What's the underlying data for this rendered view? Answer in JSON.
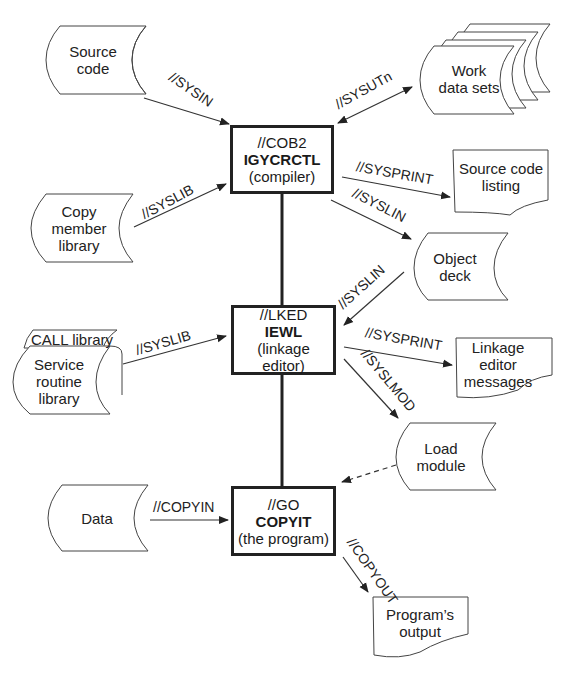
{
  "steps": {
    "compile": {
      "dd": "//COB2",
      "program": "IGYCRCTL",
      "desc": "(compiler)"
    },
    "link": {
      "dd": "//LKED",
      "program": "IEWL",
      "desc1": "(linkage",
      "desc2": "editor)"
    },
    "go": {
      "dd": "//GO",
      "program": "COPYIT",
      "desc": "(the program)"
    }
  },
  "datasets": {
    "source_code": {
      "line1": "Source",
      "line2": "code"
    },
    "work_data_sets": {
      "line1": "Work",
      "line2": "data sets"
    },
    "copy_member_library": {
      "line1": "Copy",
      "line2": "member",
      "line3": "library"
    },
    "source_code_listing": {
      "line1": "Source code",
      "line2": "listing"
    },
    "object_deck": {
      "line1": "Object",
      "line2": "deck"
    },
    "call_library": {
      "label": "CALL library"
    },
    "service_routine_library": {
      "line1": "Service",
      "line2": "routine",
      "line3": "library"
    },
    "linkage_editor_messages": {
      "line1": "Linkage",
      "line2": "editor",
      "line3": "messages"
    },
    "load_module": {
      "line1": "Load",
      "line2": "module"
    },
    "data": {
      "line1": "Data"
    },
    "programs_output": {
      "line1": "Program’s",
      "line2": "output"
    }
  },
  "dd_labels": {
    "sysin": "//SYSIN",
    "sysutn": "//SYSUTn",
    "syslib_compile": "//SYSLIB",
    "sysprint_compile": "//SYSPRINT",
    "syslin_out": "//SYSLIN",
    "syslin_in": "//SYSLIN",
    "syslib_link": "//SYSLIB",
    "sysprint_link": "//SYSPRINT",
    "syslmod": "//SYSLMOD",
    "copyin": "//COPYIN",
    "copyout": "//COPYOUT"
  }
}
